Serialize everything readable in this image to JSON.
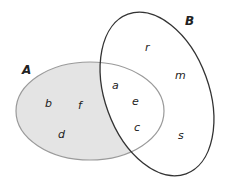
{
  "diagram": {
    "type": "venn",
    "sets": [
      {
        "name": "A",
        "label": "A",
        "only_elements": [
          "b",
          "f",
          "d"
        ]
      },
      {
        "name": "B",
        "label": "B",
        "only_elements": [
          "r",
          "m",
          "s"
        ]
      }
    ],
    "intersection": [
      "a",
      "e",
      "c"
    ],
    "shaded_region": "A only (A − B)",
    "colors": {
      "shade": "#e4e4e4",
      "a_border": "#9a9a9a",
      "b_border": "#333333"
    },
    "labels": {
      "A": "A",
      "B": "B",
      "r": "r",
      "m": "m",
      "s": "s",
      "a": "a",
      "e": "e",
      "c": "c",
      "b": "b",
      "f": "f",
      "d": "d"
    }
  }
}
